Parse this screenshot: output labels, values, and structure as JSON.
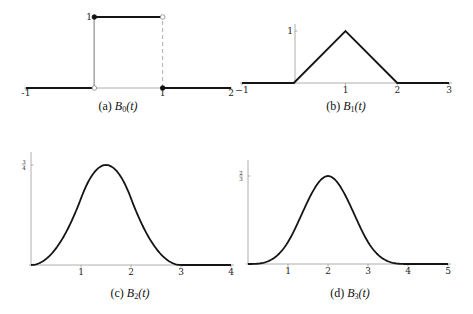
{
  "chart_data": [
    {
      "id": "a",
      "type": "line",
      "title": "B0(t)",
      "caption_prefix": "(a)",
      "caption_fn": "B",
      "caption_sub": "0",
      "caption_arg": "(t)",
      "xlim": [
        -1,
        2
      ],
      "ylim": [
        0,
        1
      ],
      "x_ticks": [
        "-1",
        "1",
        "2"
      ],
      "x_tick_values": [
        -1,
        1,
        2
      ],
      "y_ticks": [
        "1"
      ],
      "y_tick_values": [
        1
      ],
      "segments": [
        {
          "x": [
            -1,
            0
          ],
          "y": [
            0,
            0
          ]
        },
        {
          "x": [
            0,
            1
          ],
          "y": [
            1,
            1
          ]
        },
        {
          "x": [
            1,
            2
          ],
          "y": [
            0,
            0
          ]
        }
      ],
      "points": [
        {
          "x": 0,
          "y": 1,
          "filled": true
        },
        {
          "x": 1,
          "y": 1,
          "filled": false
        },
        {
          "x": 0,
          "y": 0,
          "filled": false
        },
        {
          "x": 1,
          "y": 0,
          "filled": true
        }
      ],
      "guides": [
        {
          "x": 0,
          "style": "solid"
        },
        {
          "x": 1,
          "style": "dashed"
        }
      ]
    },
    {
      "id": "b",
      "type": "line",
      "title": "B1(t)",
      "caption_prefix": "(b)",
      "caption_fn": "B",
      "caption_sub": "1",
      "caption_arg": "(t)",
      "xlim": [
        -1,
        3
      ],
      "ylim": [
        0,
        1
      ],
      "x_ticks": [
        "−1",
        "1",
        "2",
        "3"
      ],
      "x_tick_values": [
        -1,
        1,
        2,
        3
      ],
      "y_ticks": [
        "1"
      ],
      "y_tick_values": [
        1
      ],
      "x": [
        -1,
        0,
        1,
        2,
        3
      ],
      "y": [
        0,
        0,
        1,
        0,
        0
      ]
    },
    {
      "id": "c",
      "type": "line",
      "title": "B2(t)",
      "caption_prefix": "(c)",
      "caption_fn": "B",
      "caption_sub": "2",
      "caption_arg": "(t)",
      "xlim": [
        0,
        4
      ],
      "ylim": [
        0,
        0.75
      ],
      "x_ticks": [
        "1",
        "2",
        "3",
        "4"
      ],
      "x_tick_values": [
        1,
        2,
        3,
        4
      ],
      "y_ticks": [
        "3/4"
      ],
      "y_tick_values": [
        0.75
      ],
      "function": "quadratic B-spline on [0,3], zero on [3,4]",
      "peak": {
        "x": 1.5,
        "y": 0.75
      }
    },
    {
      "id": "d",
      "type": "line",
      "title": "B3(t)",
      "caption_prefix": "(d)",
      "caption_fn": "B",
      "caption_sub": "3",
      "caption_arg": "(t)",
      "xlim": [
        0,
        5
      ],
      "ylim": [
        0,
        0.6667
      ],
      "x_ticks": [
        "1",
        "2",
        "3",
        "4",
        "5"
      ],
      "x_tick_values": [
        1,
        2,
        3,
        4,
        5
      ],
      "y_ticks": [
        "2/3"
      ],
      "y_tick_values": [
        0.6667
      ],
      "function": "cubic B-spline on [0,4], zero on [4,5]",
      "peak": {
        "x": 2,
        "y": 0.6667
      }
    }
  ],
  "colors": {
    "curve": "#151515",
    "axis": "#9a9a9a"
  }
}
